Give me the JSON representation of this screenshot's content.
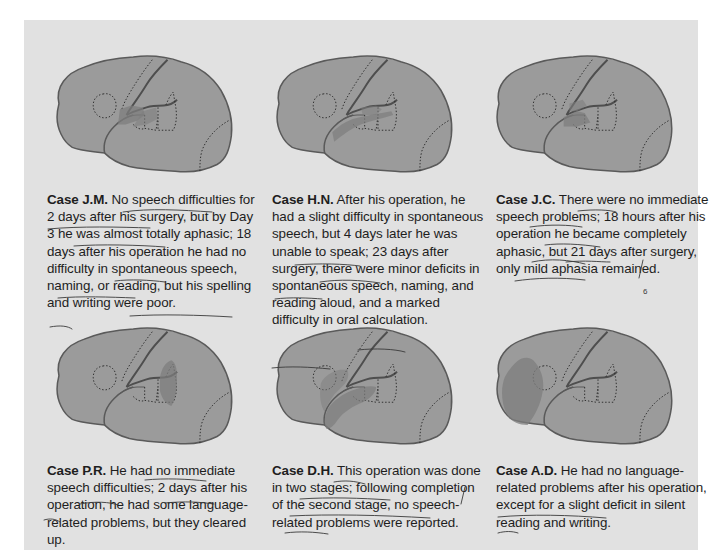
{
  "figure": {
    "background_color": "#e1e1e1",
    "brain_fill": "#9b9b9b",
    "brain_outline": "#5a5a5a",
    "lesion_fill": "#7e7e7e",
    "text_color": "#1e1e1e"
  },
  "cases": [
    {
      "id": "J.M.",
      "title": "Case J.M.",
      "text": "No speech difficulties for 2 days after his surgery, but by Day 3 he was almost totally aphasic; 18 days after his operation he had no difficulty in spontaneous speech, naming, or reading, but his spelling and writing were poor.",
      "lesion": "posterior-temporal-small"
    },
    {
      "id": "H.N.",
      "title": "Case H.N.",
      "text": "After his operation, he had a slight difficulty in spontaneous speech, but 4 days later he was unable to speak; 23 days after surgery, there were minor deficits in spontaneous speech, naming, and reading aloud, and a marked difficulty in oral calculation.",
      "lesion": "superior-temporal-strip"
    },
    {
      "id": "J.C.",
      "title": "Case J.C.",
      "text": "There were no immediate speech problems; 18 hours after his operation he became completely aphasic, but 21 days after surgery, only mild aphasia remained.",
      "lesion": "central-sylvian-small"
    },
    {
      "id": "P.R.",
      "title": "Case P.R.",
      "text": "He had no immediate speech difficulties; 2 days after his operation, he had some language-related problems, but they cleared up.",
      "lesion": "parietal-supramarginal"
    },
    {
      "id": "D.H.",
      "title": "Case D.H.",
      "text": "This operation was done in two stages; following completion of the second stage, no speech-related problems were reported.",
      "lesion": "anterior-temporal-frontal-operculum"
    },
    {
      "id": "A.D.",
      "title": "Case A.D.",
      "text": "He had no language-related problems after his operation, except for a slight deficit in silent reading and writing.",
      "lesion": "frontal-pole-large"
    }
  ],
  "annotations": {
    "margin_mark": "6"
  }
}
